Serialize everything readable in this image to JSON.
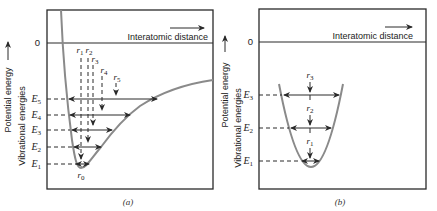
{
  "panel_a": {
    "zero_label": "0",
    "x_axis_label": "Interatomic distance",
    "y_axis_label_1": "Potential energy",
    "y_axis_label_2": "Vibrational energies",
    "caption": "(a)",
    "levels": [
      {
        "name": "E",
        "sub": "1"
      },
      {
        "name": "E",
        "sub": "2"
      },
      {
        "name": "E",
        "sub": "3"
      },
      {
        "name": "E",
        "sub": "4"
      },
      {
        "name": "E",
        "sub": "5"
      }
    ],
    "positions": [
      {
        "name": "r",
        "sub": "0"
      },
      {
        "name": "r",
        "sub": "1"
      },
      {
        "name": "r",
        "sub": "2"
      },
      {
        "name": "r",
        "sub": "3"
      },
      {
        "name": "r",
        "sub": "4"
      },
      {
        "name": "r",
        "sub": "5"
      }
    ]
  },
  "panel_b": {
    "zero_label": "0",
    "x_axis_label": "Interatomic distance",
    "y_axis_label_1": "Potential energy",
    "y_axis_label_2": "Vibrational energies",
    "caption": "(b)",
    "levels": [
      {
        "name": "E",
        "sub": "1"
      },
      {
        "name": "E",
        "sub": "2"
      },
      {
        "name": "E",
        "sub": "3"
      }
    ],
    "positions": [
      {
        "name": "r",
        "sub": "1"
      },
      {
        "name": "r",
        "sub": "2"
      },
      {
        "name": "r",
        "sub": "3"
      }
    ]
  },
  "colors": {
    "curve": "#8a8a8a",
    "lines": "#2a2a2a"
  }
}
